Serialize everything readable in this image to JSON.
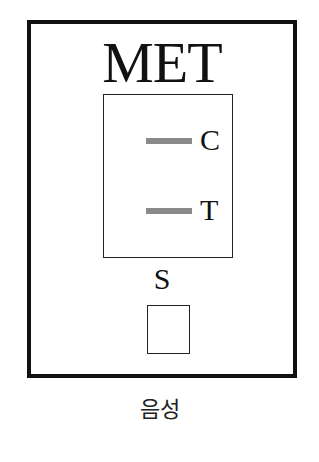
{
  "cassette": {
    "title": "MET",
    "bands": {
      "control": {
        "label": "C",
        "color": "#8a8a8a"
      },
      "test": {
        "label": "T",
        "color": "#8a8a8a"
      }
    },
    "sample_well_label": "S"
  },
  "result": {
    "label": "음성"
  }
}
